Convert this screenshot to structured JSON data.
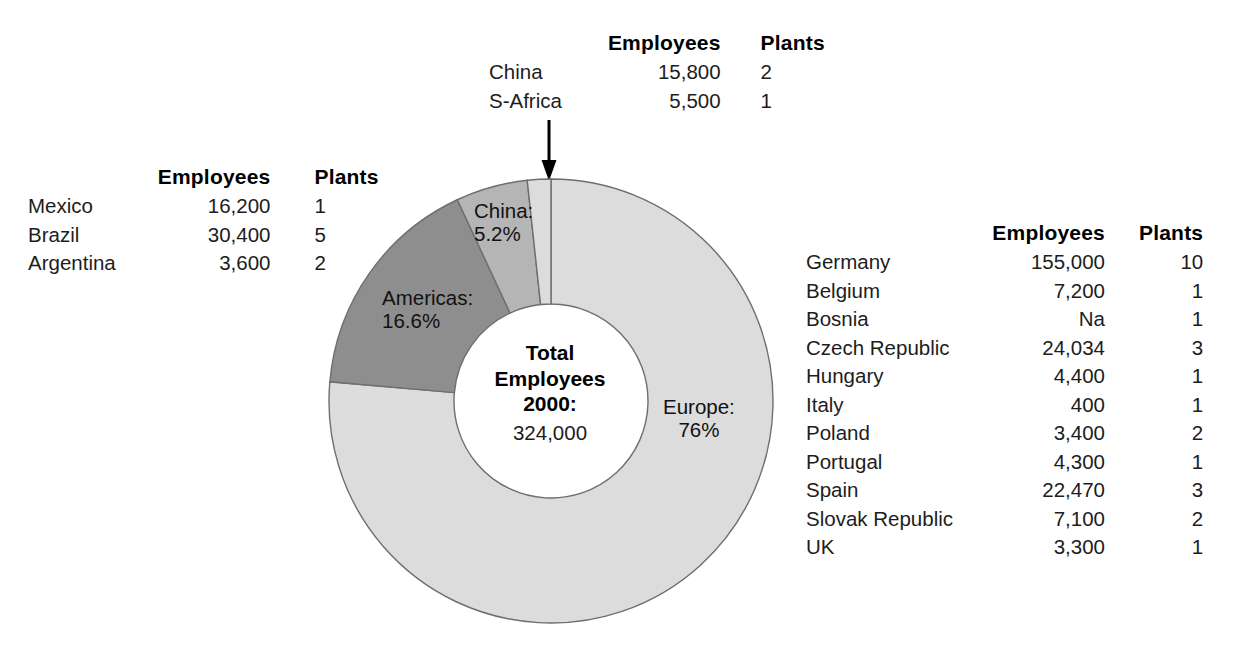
{
  "chart_data": {
    "type": "pie",
    "title": "Total Employees 2000",
    "total_label_line1": "Total",
    "total_label_line2": "Employees",
    "total_label_line3": "2000:",
    "total_value": "324,000",
    "donut": true,
    "legend_position": "on-slice",
    "slices": [
      {
        "name": "Europe",
        "label": "Europe:",
        "percent_label": "76%",
        "value": 76.0,
        "color": "#dcdcdc"
      },
      {
        "name": "Americas",
        "label": "Americas:",
        "percent_label": "16.6%",
        "value": 16.6,
        "color": "#8e8e8e"
      },
      {
        "name": "China",
        "label": "China:",
        "percent_label": "5.2%",
        "value": 5.2,
        "color": "#b5b5b5"
      },
      {
        "name": "S-Africa",
        "label": "S-Africa",
        "percent_label": "",
        "value": 1.7,
        "color": "#dcdcdc"
      }
    ],
    "categories": [
      "Europe",
      "Americas",
      "China",
      "S-Africa"
    ],
    "values": [
      76.0,
      16.6,
      5.2,
      1.7
    ]
  },
  "tables": {
    "asia_africa": {
      "headers": {
        "name": "",
        "employees": "Employees",
        "plants": "Plants"
      },
      "rows": [
        {
          "name": "China",
          "employees": "15,800",
          "plants": "2"
        },
        {
          "name": "S-Africa",
          "employees": "5,500",
          "plants": "1"
        }
      ]
    },
    "americas": {
      "headers": {
        "name": "",
        "employees": "Employees",
        "plants": "Plants"
      },
      "rows": [
        {
          "name": "Mexico",
          "employees": "16,200",
          "plants": "1"
        },
        {
          "name": "Brazil",
          "employees": "30,400",
          "plants": "5"
        },
        {
          "name": "Argentina",
          "employees": "3,600",
          "plants": "2"
        }
      ]
    },
    "europe": {
      "headers": {
        "name": "",
        "employees": "Employees",
        "plants": "Plants"
      },
      "rows": [
        {
          "name": "Germany",
          "employees": "155,000",
          "plants": "10"
        },
        {
          "name": "Belgium",
          "employees": "7,200",
          "plants": "1"
        },
        {
          "name": "Bosnia",
          "employees": "Na",
          "plants": "1"
        },
        {
          "name": "Czech Republic",
          "employees": "24,034",
          "plants": "3"
        },
        {
          "name": "Hungary",
          "employees": "4,400",
          "plants": "1"
        },
        {
          "name": "Italy",
          "employees": "400",
          "plants": "1"
        },
        {
          "name": "Poland",
          "employees": "3,400",
          "plants": "2"
        },
        {
          "name": "Portugal",
          "employees": "4,300",
          "plants": "1"
        },
        {
          "name": "Spain",
          "employees": "22,470",
          "plants": "3"
        },
        {
          "name": "Slovak Republic",
          "employees": "7,100",
          "plants": "2"
        },
        {
          "name": "UK",
          "employees": "3,300",
          "plants": "1"
        }
      ]
    }
  },
  "annotations": {
    "pointer": "arrow-down-to-asia-africa-slices"
  }
}
